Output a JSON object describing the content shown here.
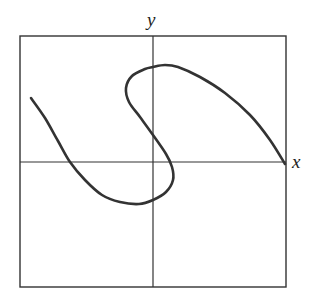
{
  "chart_data": {
    "type": "line",
    "title": "",
    "xlabel": "x",
    "ylabel": "y",
    "grid": false,
    "legend": null,
    "axes": {
      "frame": {
        "left": 20,
        "top": 36,
        "right": 286,
        "bottom": 287
      },
      "origin_px": {
        "x": 153,
        "y": 162
      }
    },
    "series": [
      {
        "name": "curve",
        "color": "#333333",
        "stroke_width": 2.6,
        "points_px": [
          [
            31,
            98
          ],
          [
            45,
            118
          ],
          [
            58,
            141
          ],
          [
            70,
            162
          ],
          [
            85,
            180
          ],
          [
            102,
            195
          ],
          [
            120,
            202
          ],
          [
            139,
            204
          ],
          [
            153,
            200
          ],
          [
            166,
            192
          ],
          [
            173,
            180
          ],
          [
            172,
            167
          ],
          [
            166,
            154
          ],
          [
            153,
            135
          ],
          [
            140,
            117
          ],
          [
            129,
            102
          ],
          [
            126,
            88
          ],
          [
            132,
            76
          ],
          [
            145,
            69
          ],
          [
            153,
            67
          ],
          [
            165,
            65
          ],
          [
            178,
            67
          ],
          [
            200,
            77
          ],
          [
            225,
            93
          ],
          [
            250,
            115
          ],
          [
            270,
            140
          ],
          [
            285,
            164
          ]
        ]
      }
    ]
  },
  "labels": {
    "x_axis": "x",
    "y_axis": "y"
  }
}
